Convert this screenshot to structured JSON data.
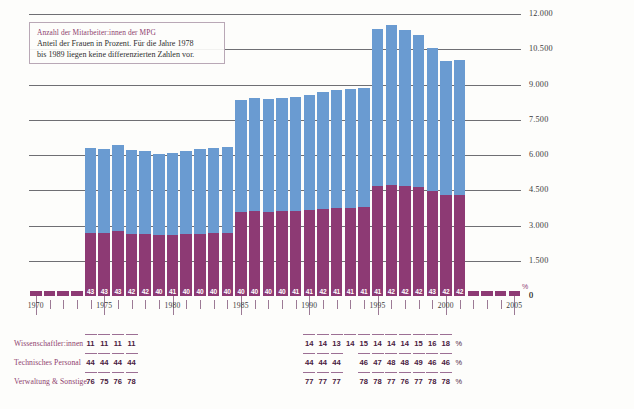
{
  "caption": {
    "title": "Anzahl der Mitarbeiter:innen der MPG",
    "line1": "Anteil der Frauen in Prozent. Für die Jahre 1978",
    "line2": "bis 1989 liegen keine differenzierten Zahlen vor."
  },
  "colors": {
    "top_segment": "#6a9bd1",
    "bottom_segment": "#8d3a74",
    "accent_text": "#8e3d6e",
    "grid": "#56565a",
    "axis": "#9c7a95"
  },
  "axis": {
    "y_ticks": [
      "0",
      "1.500",
      "3.000",
      "4.500",
      "6.000",
      "7.500",
      "9.000",
      "10.500",
      "12.000"
    ],
    "x_year_labels": [
      "1970",
      "1975",
      "1980",
      "1985",
      "1990",
      "1995",
      "2000",
      "2005"
    ],
    "percent_sign": "%"
  },
  "legend_rows": [
    {
      "label": "Wissenschaftler:innen",
      "values_left": [
        "11",
        "11",
        "11",
        "11"
      ],
      "values_right": [
        "14",
        "14",
        "13",
        "14",
        "15",
        "14",
        "14",
        "14",
        "15",
        "16",
        "18"
      ],
      "unit": "%"
    },
    {
      "label": "Technisches Personal",
      "values_left": [
        "44",
        "44",
        "44",
        "44"
      ],
      "values_right": [
        "44",
        "44",
        "44",
        "",
        "46",
        "47",
        "48",
        "48",
        "49",
        "46",
        "46"
      ],
      "unit": "%"
    },
    {
      "label": "Verwaltung & Sonstige",
      "values_left": [
        "76",
        "75",
        "76",
        "78"
      ],
      "values_right": [
        "77",
        "77",
        "77",
        "",
        "78",
        "78",
        "77",
        "76",
        "77",
        "78",
        "78"
      ],
      "unit": "%"
    }
  ],
  "chart_data": {
    "type": "bar",
    "title": "Anzahl der Mitarbeiter:innen der MPG",
    "subtitle": "Anteil der Frauen in Prozent. Für die Jahre 1978 bis 1989 liegen keine differenzierten Zahlen vor.",
    "xlabel": "",
    "ylabel": "",
    "ylim": [
      0,
      12000
    ],
    "grid": true,
    "legend_position": "none",
    "stacked": true,
    "categories": [
      "1970",
      "1971",
      "1972",
      "1973",
      "1974",
      "1975",
      "1976",
      "1977",
      "1978",
      "1979",
      "1980",
      "1981",
      "1982",
      "1983",
      "1984",
      "1985",
      "1986",
      "1987",
      "1988",
      "1989",
      "1990",
      "1991",
      "1992",
      "1993",
      "1994",
      "1995",
      "1996",
      "1997",
      "1998",
      "1999",
      "2000",
      "2001",
      "2002",
      "2003",
      "2004",
      "2005"
    ],
    "series": [
      {
        "name": "Männer (oberes Segment, blau)",
        "color": "#6a9bd1",
        "values": [
          0,
          0,
          0,
          0,
          3600,
          3580,
          3680,
          3560,
          3540,
          3480,
          3500,
          3560,
          3580,
          3620,
          3640,
          4780,
          4820,
          4800,
          4820,
          4860,
          4900,
          4980,
          5020,
          5040,
          5060,
          6700,
          6800,
          6650,
          6450,
          6080,
          5720,
          5740,
          0,
          0,
          0,
          0
        ]
      },
      {
        "name": "Frauen (unteres Segment, violett)",
        "color": "#8d3a74",
        "values": [
          120,
          120,
          120,
          120,
          2700,
          2680,
          2760,
          2640,
          2620,
          2580,
          2580,
          2620,
          2660,
          2680,
          2700,
          3560,
          3600,
          3580,
          3600,
          3620,
          3660,
          3720,
          3740,
          3760,
          3780,
          4680,
          4720,
          4680,
          4640,
          4460,
          4280,
          4300,
          120,
          120,
          120,
          120
        ]
      }
    ],
    "bar_percent_labels": [
      "",
      "",
      "",
      "",
      "43",
      "43",
      "43",
      "42",
      "42",
      "40",
      "41",
      "40",
      "40",
      "40",
      "40",
      "40",
      "40",
      "40",
      "40",
      "41",
      "41",
      "42",
      "41",
      "41",
      "41",
      "41",
      "42",
      "42",
      "42",
      "43",
      "42",
      "42",
      "",
      "",
      "",
      ""
    ],
    "totals_approx": [
      120,
      120,
      120,
      120,
      6300,
      6260,
      6440,
      6200,
      6160,
      6060,
      6080,
      6180,
      6240,
      6300,
      6340,
      8340,
      8420,
      8380,
      8420,
      8480,
      8560,
      8700,
      8760,
      8800,
      8840,
      11380,
      11520,
      11330,
      11090,
      10540,
      10000,
      10040,
      120,
      120,
      120,
      120
    ]
  }
}
